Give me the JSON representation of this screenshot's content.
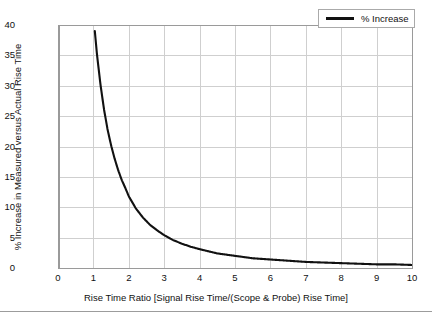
{
  "chart_data": {
    "type": "line",
    "title": "",
    "xlabel": "Rise Time Ratio [Signal Rise Time/(Scope & Probe) Rise Time]",
    "ylabel": "% Increase in Measured versus Actual Rise Time",
    "xlim": [
      0,
      10
    ],
    "ylim": [
      0,
      40
    ],
    "xticks": [
      "0",
      "1",
      "2",
      "3",
      "4",
      "5",
      "6",
      "7",
      "8",
      "9",
      "10"
    ],
    "yticks": [
      "0",
      "5",
      "10",
      "15",
      "20",
      "25",
      "30",
      "35",
      "40"
    ],
    "grid": true,
    "legend_position": "top-right",
    "series": [
      {
        "name": "% Increase",
        "color": "#111111",
        "x": [
          1.04,
          1.1,
          1.2,
          1.3,
          1.4,
          1.5,
          1.6,
          1.7,
          1.8,
          1.9,
          2.0,
          2.2,
          2.4,
          2.6,
          2.8,
          3.0,
          3.25,
          3.5,
          3.75,
          4.0,
          4.5,
          5.0,
          5.5,
          6.0,
          6.5,
          7.0,
          7.5,
          8.0,
          8.5,
          9.0,
          9.5,
          10.0
        ],
        "values": [
          39.0,
          35.2,
          30.2,
          26.1,
          22.8,
          20.2,
          18.0,
          16.1,
          14.5,
          13.2,
          11.8,
          9.8,
          8.3,
          7.1,
          6.2,
          5.4,
          4.6,
          4.0,
          3.5,
          3.1,
          2.4,
          2.0,
          1.6,
          1.4,
          1.2,
          1.0,
          0.9,
          0.8,
          0.7,
          0.6,
          0.6,
          0.5
        ]
      }
    ],
    "legend": [
      {
        "label": "% Increase",
        "color": "#111111"
      }
    ]
  },
  "legend": {
    "entry_label": "% Increase"
  },
  "axes": {
    "x_title": "Rise Time Ratio [Signal Rise Time/(Scope & Probe) Rise Time]",
    "y_title": "% Increase in Measured versus Actual Rise Time",
    "x_ticks": [
      "0",
      "1",
      "2",
      "3",
      "4",
      "5",
      "6",
      "7",
      "8",
      "9",
      "10"
    ],
    "y_ticks": [
      "0",
      "5",
      "10",
      "15",
      "20",
      "25",
      "30",
      "35",
      "40"
    ]
  },
  "colors": {
    "curve": "#111111",
    "grid": "#cfcfcf",
    "axis": "#9a9a9a",
    "background": "#ffffff",
    "text": "#111111"
  }
}
